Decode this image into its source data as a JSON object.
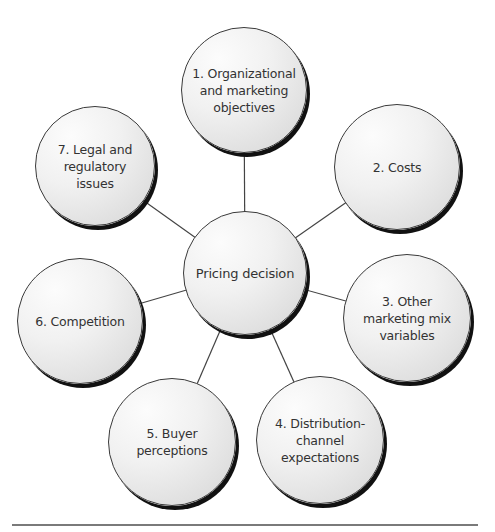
{
  "diagram": {
    "center": {
      "label": "Pricing decision",
      "x": 245,
      "y": 273,
      "r": 62
    },
    "factors": [
      {
        "number": "1.",
        "label": "1. Organizational\nand marketing\nobjectives",
        "x": 244,
        "y": 90,
        "r": 63
      },
      {
        "number": "2.",
        "label": "2.  Costs",
        "x": 397,
        "y": 167,
        "r": 63
      },
      {
        "number": "3.",
        "label": "3.  Other\nmarketing mix\nvariables",
        "x": 407,
        "y": 318,
        "r": 64
      },
      {
        "number": "4.",
        "label": "4.  Distribution-\nchannel\nexpectations",
        "x": 320,
        "y": 440,
        "r": 64
      },
      {
        "number": "5.",
        "label": "5.  Buyer\nperceptions",
        "x": 172,
        "y": 442,
        "r": 64
      },
      {
        "number": "6.",
        "label": "6.  Competition",
        "x": 80,
        "y": 321,
        "r": 63
      },
      {
        "number": "7.",
        "label": "7.  Legal and\nregulatory\nissues",
        "x": 95,
        "y": 166,
        "r": 60
      }
    ]
  },
  "colors": {
    "line": "#444444",
    "outline": "#3a3a3a",
    "shadow": "#111111",
    "rule": "#7a7a7a",
    "text": "#333333"
  }
}
